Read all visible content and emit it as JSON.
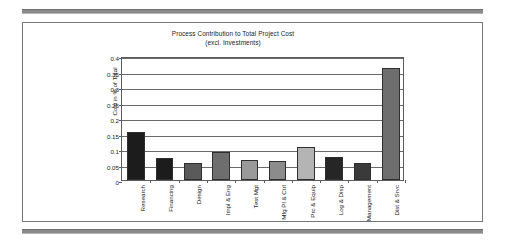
{
  "figure": {
    "title_line1": "Process Contribution to Total Project Cost",
    "title_line2": "(excl. Investments)"
  },
  "chart_data": {
    "type": "bar",
    "title": "Process Contribution to Total Project Cost (excl. Investments)",
    "xlabel": "",
    "ylabel": "Cost in % of Total",
    "ylim": [
      0,
      0.4
    ],
    "ytick_labels": [
      "0.4",
      "0.35",
      "0.3",
      "0.25",
      "0.2",
      "0.15",
      "0.1",
      "0.05",
      "0"
    ],
    "ytick_values": [
      0.4,
      0.35,
      0.3,
      0.25,
      0.2,
      0.15,
      0.1,
      0.05,
      0
    ],
    "grid": true,
    "legend": "none",
    "categories": [
      "Research",
      "Financing",
      "Design",
      "Impl & Eng",
      "Test Mgt",
      "Mfg Pl & Ctrl",
      "Prc & Equip",
      "Log & Disp",
      "Management",
      "Dist & Srvc"
    ],
    "values": [
      0.155,
      0.07,
      0.055,
      0.09,
      0.065,
      0.06,
      0.105,
      0.075,
      0.055,
      0.36
    ],
    "bar_colors": [
      "#1c1c1c",
      "#1c1c1c",
      "#5a5a5a",
      "#6e6e6e",
      "#9a9a9a",
      "#8c8c8c",
      "#b4b4b4",
      "#262626",
      "#3a3a3a",
      "#6e6e6e"
    ]
  }
}
